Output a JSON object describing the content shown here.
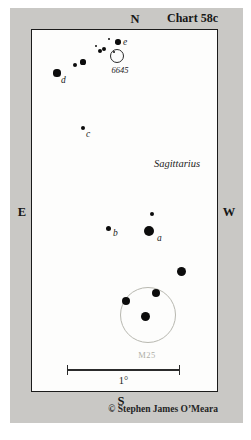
{
  "header": {
    "north_label": "N",
    "chart_title": "Chart 58c"
  },
  "sides": {
    "east_label": "E",
    "west_label": "W"
  },
  "footer": {
    "south_label": "S",
    "copyright": "© Stephen James O’Meara"
  },
  "map": {
    "constellation_label": "Sagittarius",
    "scale_label": "1°",
    "stars": [
      {
        "x": 57,
        "y": 73,
        "r": 3.6,
        "label": "d",
        "lx": 61,
        "ly": 76
      },
      {
        "x": 75,
        "y": 65,
        "r": 2.2
      },
      {
        "x": 83,
        "y": 62,
        "r": 2.6
      },
      {
        "x": 96,
        "y": 46,
        "r": 1.2
      },
      {
        "x": 100,
        "y": 51,
        "r": 2.3
      },
      {
        "x": 104,
        "y": 49,
        "r": 2.3
      },
      {
        "x": 109,
        "y": 39,
        "r": 1.2
      },
      {
        "x": 118,
        "y": 42,
        "r": 2.7,
        "label": "e",
        "lx": 123,
        "ly": 38
      },
      {
        "x": 114,
        "y": 52,
        "r": 1.3
      },
      {
        "x": 83,
        "y": 128,
        "r": 2.2,
        "label": "c",
        "lx": 86,
        "ly": 130
      },
      {
        "x": 152,
        "y": 214,
        "r": 2.0
      },
      {
        "x": 108,
        "y": 228,
        "r": 2.5,
        "label": "b",
        "lx": 113,
        "ly": 229
      },
      {
        "x": 149,
        "y": 231,
        "r": 5.0,
        "label": "a",
        "lx": 157,
        "ly": 234
      },
      {
        "x": 181,
        "y": 271,
        "r": 4.5
      },
      {
        "x": 126,
        "y": 301,
        "r": 4.0
      },
      {
        "x": 156,
        "y": 293,
        "r": 4.0
      },
      {
        "x": 145,
        "y": 316,
        "r": 4.5
      }
    ],
    "clusters": [
      {
        "id": "ngc6645",
        "label": "6645",
        "x": 117,
        "y": 56,
        "r": 7,
        "label_x": 120,
        "label_y": 66
      },
      {
        "id": "m25",
        "label": "M25",
        "x": 148,
        "y": 315,
        "r": 28,
        "label_x": 147,
        "label_y": 351
      }
    ]
  },
  "colors": {
    "frame_gray": "#c9c8c5",
    "ink": "#1b1b1b",
    "faint_gray": "#aeaea6"
  }
}
